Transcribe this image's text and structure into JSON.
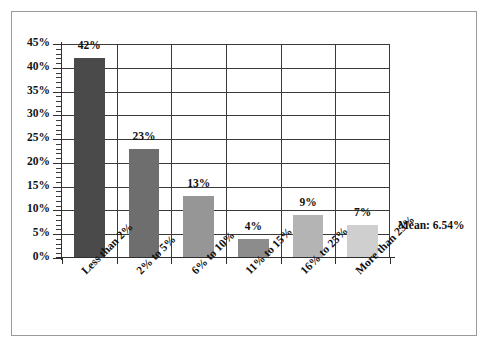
{
  "chart_data": {
    "type": "bar",
    "title": "",
    "subtitle": "",
    "xlabel": "",
    "ylabel": "",
    "categories": [
      "Less than 2%",
      "2% to 5%",
      "6% to 10%",
      "11% to 15%",
      "16% to 25%",
      "More than 25%"
    ],
    "values": [
      42,
      23,
      13,
      4,
      9,
      7
    ],
    "value_labels": [
      "42%",
      "23%",
      "13%",
      "4%",
      "9%",
      "7%"
    ],
    "bar_colors": [
      "#4a4a4a",
      "#6e6e6e",
      "#969696",
      "#8c8c8c",
      "#b4b4b4",
      "#cfcfcf"
    ],
    "ylim": [
      0,
      45
    ],
    "ytick_labels": [
      "0%",
      "5%",
      "10%",
      "15%",
      "20%",
      "25%",
      "30%",
      "35%",
      "40%",
      "45%"
    ],
    "ytick_values": [
      0,
      5,
      10,
      15,
      20,
      25,
      30,
      35,
      40,
      45
    ],
    "ytick_minor_step": 1,
    "grid": "horizontal-and-vertical",
    "legend": "none",
    "annotations": [
      {
        "name": "mean-annotation",
        "text": "Mean: 6.54%",
        "value": 6.54
      }
    ],
    "axis_color": "#2e2e2e",
    "grid_color": "#3a3a3a",
    "background": "#ffffff",
    "frame_color": "#9a9a9a"
  }
}
